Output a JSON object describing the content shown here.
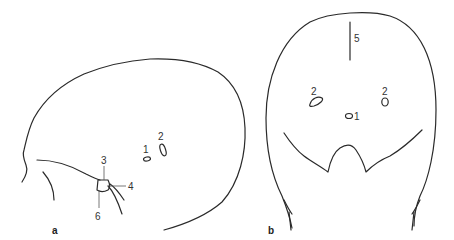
{
  "figure": {
    "panels": [
      {
        "id": "a",
        "label": "a",
        "view": "lateral",
        "markers": [
          {
            "number": "1"
          },
          {
            "number": "2"
          },
          {
            "number": "3"
          },
          {
            "number": "4"
          },
          {
            "number": "6"
          }
        ]
      },
      {
        "id": "b",
        "label": "b",
        "view": "frontal",
        "markers": [
          {
            "number": "5"
          },
          {
            "number": "2",
            "side": "left"
          },
          {
            "number": "2",
            "side": "right"
          },
          {
            "number": "1"
          }
        ]
      }
    ],
    "line_color": "#2a2a2a",
    "background": "#ffffff"
  }
}
